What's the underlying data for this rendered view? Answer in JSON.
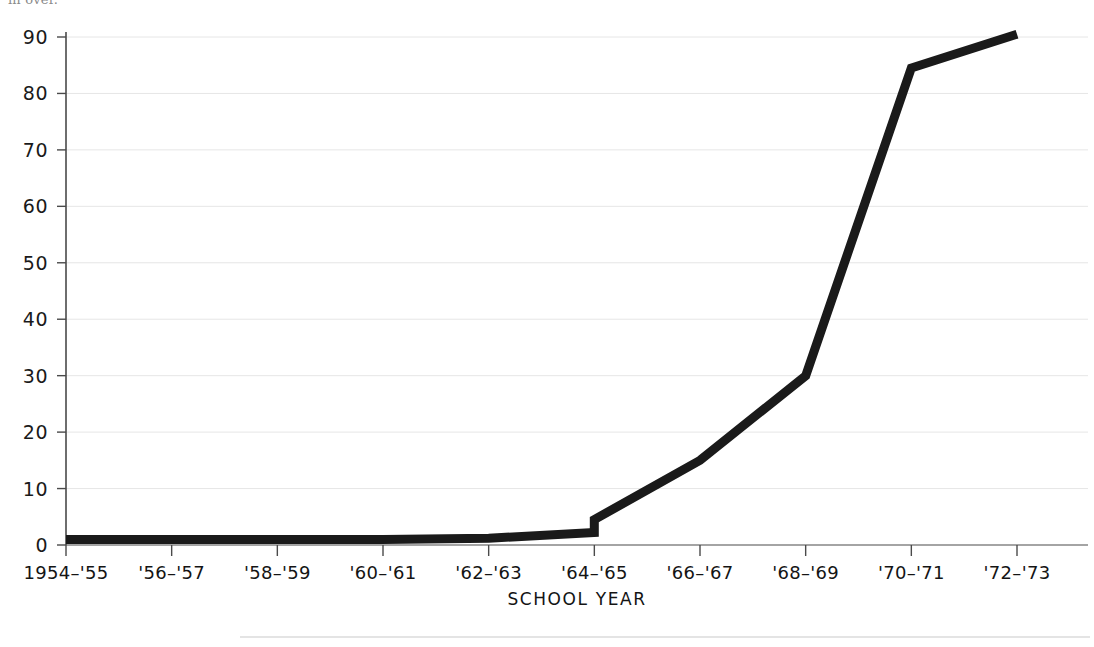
{
  "figure": {
    "top_fragment": "in over.",
    "background_color": "#ffffff",
    "line_color": "#1a1a1a",
    "grid_color": "#e6e6e6",
    "axis_color": "#4a4a4a",
    "footer_rule_color": "#c9c9c9"
  },
  "chart_data": {
    "type": "line",
    "title": "",
    "subtitle": "",
    "xlabel": "SCHOOL  YEAR",
    "ylabel": "",
    "categories": [
      "1954–'55",
      "'56–'57",
      "'58–'59",
      "'60–'61",
      "'62–'63",
      "'64–'65",
      "'66–'67",
      "'68–'69",
      "'70–'71",
      "'72–'73"
    ],
    "values": [
      1,
      1,
      1,
      1,
      1.2,
      4.5,
      15,
      30,
      84.5,
      90.5
    ],
    "step_note": {
      "at_category": "'64–'65",
      "value_before_step": 2.2,
      "value_after_step": 4.5
    },
    "ylim": [
      0,
      93
    ],
    "xlim": [
      0,
      9
    ],
    "yticks": [
      0,
      10,
      20,
      30,
      40,
      50,
      60,
      70,
      80,
      90
    ],
    "ytick_labels": [
      "0",
      "10",
      "20",
      "30",
      "40",
      "50",
      "60",
      "70",
      "80",
      "90"
    ],
    "grid": "horizontal",
    "legend": "none",
    "series": [
      {
        "name": "series-1",
        "values": [
          1,
          1,
          1,
          1,
          1.2,
          4.5,
          15,
          30,
          84.5,
          90.5
        ]
      }
    ],
    "annotations": []
  }
}
